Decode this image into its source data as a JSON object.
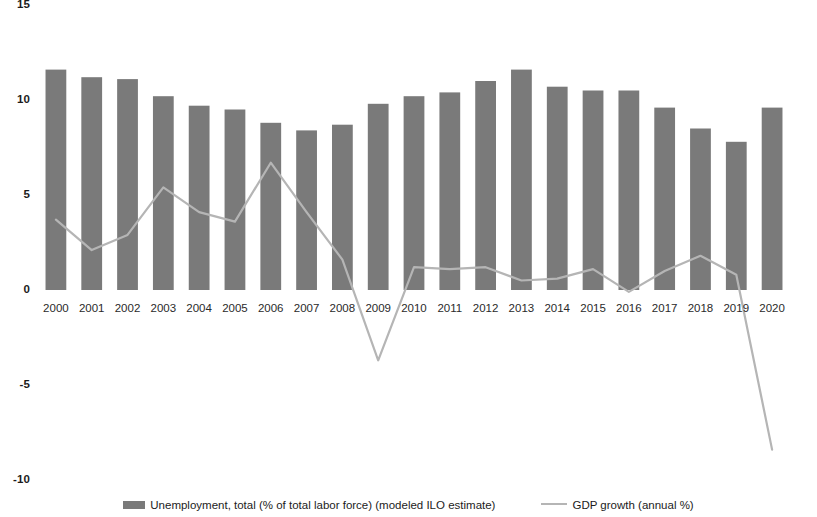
{
  "chart_data": {
    "type": "bar",
    "title": "",
    "subtitle": "",
    "xlabel": "",
    "ylabel": "",
    "ylim": [
      -10,
      15
    ],
    "yticks": [
      15,
      10,
      5,
      0,
      -5,
      -10
    ],
    "ytick_labels": [
      "15",
      "10",
      "5",
      "0",
      "-5",
      "-10"
    ],
    "grid": false,
    "legend_position": "bottom",
    "categories": [
      "2000",
      "2001",
      "2002",
      "2003",
      "2004",
      "2005",
      "2006",
      "2007",
      "2008",
      "2009",
      "2010",
      "2011",
      "2012",
      "2013",
      "2014",
      "2015",
      "2016",
      "2017",
      "2018",
      "2019",
      "2020"
    ],
    "series": [
      {
        "name": "Unemployment, total (% of total labor force) (modeled ILO estimate)",
        "type": "bar",
        "color": "#7a7a7a",
        "values": [
          11.6,
          11.2,
          11.1,
          10.2,
          9.7,
          9.5,
          8.8,
          8.4,
          8.7,
          9.8,
          10.2,
          10.4,
          11.0,
          11.6,
          10.7,
          10.5,
          10.5,
          9.6,
          8.5,
          7.8,
          9.6
        ]
      },
      {
        "name": "GDP growth (annual %)",
        "type": "line",
        "color": "#b5b5b5",
        "values": [
          3.7,
          2.1,
          2.9,
          5.4,
          4.1,
          3.6,
          6.7,
          4.1,
          1.6,
          -3.7,
          1.2,
          1.1,
          1.2,
          0.5,
          0.6,
          1.1,
          -0.1,
          1.0,
          1.8,
          0.8,
          -8.4
        ]
      }
    ]
  },
  "legend": {
    "bar_label": "Unemployment, total (% of total labor force) (modeled ILO estimate)",
    "line_label": "GDP growth (annual %)"
  }
}
